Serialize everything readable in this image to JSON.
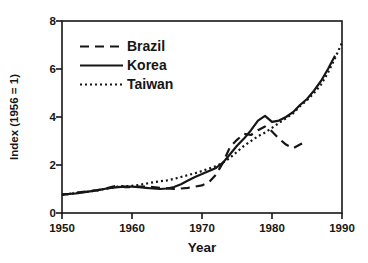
{
  "figure": {
    "background": "#ffffff",
    "ink_color": "#161616"
  },
  "chart_data": {
    "type": "line",
    "title": "",
    "xlabel": "Year",
    "ylabel": "Index (1956 = 1)",
    "xlim": [
      1950,
      1990
    ],
    "ylim": [
      0,
      8
    ],
    "x_ticks": [
      "1950",
      "1960",
      "1970",
      "1980",
      "1990"
    ],
    "y_ticks": [
      "0",
      "2",
      "4",
      "6",
      "8"
    ],
    "grid": false,
    "legend_position": "top-left",
    "series": [
      {
        "name": "Brazil",
        "line_style": "dashed",
        "points": [
          [
            1950,
            0.78
          ],
          [
            1951,
            0.8
          ],
          [
            1952,
            0.84
          ],
          [
            1953,
            0.88
          ],
          [
            1954,
            0.92
          ],
          [
            1955,
            0.95
          ],
          [
            1956,
            1.0
          ],
          [
            1957,
            1.08
          ],
          [
            1958,
            1.15
          ],
          [
            1959,
            1.08
          ],
          [
            1960,
            1.07
          ],
          [
            1961,
            1.1
          ],
          [
            1962,
            1.1
          ],
          [
            1963,
            1.08
          ],
          [
            1964,
            1.05
          ],
          [
            1965,
            1.03
          ],
          [
            1966,
            1.0
          ],
          [
            1967,
            1.02
          ],
          [
            1968,
            1.05
          ],
          [
            1969,
            1.1
          ],
          [
            1970,
            1.15
          ],
          [
            1971,
            1.28
          ],
          [
            1972,
            1.6
          ],
          [
            1973,
            2.1
          ],
          [
            1974,
            2.75
          ],
          [
            1975,
            3.05
          ],
          [
            1976,
            3.3
          ],
          [
            1977,
            3.25
          ],
          [
            1978,
            3.45
          ],
          [
            1979,
            3.6
          ],
          [
            1980,
            3.4
          ],
          [
            1981,
            3.1
          ],
          [
            1982,
            2.85
          ],
          [
            1983,
            2.7
          ],
          [
            1984,
            2.85
          ],
          [
            1985,
            3.0
          ]
        ]
      },
      {
        "name": "Korea",
        "line_style": "solid",
        "points": [
          [
            1950,
            0.75
          ],
          [
            1951,
            0.79
          ],
          [
            1952,
            0.82
          ],
          [
            1953,
            0.86
          ],
          [
            1954,
            0.9
          ],
          [
            1955,
            0.94
          ],
          [
            1956,
            1.0
          ],
          [
            1957,
            1.05
          ],
          [
            1958,
            1.08
          ],
          [
            1959,
            1.1
          ],
          [
            1960,
            1.1
          ],
          [
            1961,
            1.08
          ],
          [
            1962,
            1.05
          ],
          [
            1963,
            1.02
          ],
          [
            1964,
            1.0
          ],
          [
            1965,
            1.02
          ],
          [
            1966,
            1.08
          ],
          [
            1967,
            1.2
          ],
          [
            1968,
            1.35
          ],
          [
            1969,
            1.5
          ],
          [
            1970,
            1.62
          ],
          [
            1971,
            1.75
          ],
          [
            1972,
            1.88
          ],
          [
            1973,
            2.1
          ],
          [
            1974,
            2.45
          ],
          [
            1975,
            2.8
          ],
          [
            1976,
            3.1
          ],
          [
            1977,
            3.45
          ],
          [
            1978,
            3.85
          ],
          [
            1979,
            4.05
          ],
          [
            1980,
            3.8
          ],
          [
            1981,
            3.85
          ],
          [
            1982,
            4.0
          ],
          [
            1983,
            4.2
          ],
          [
            1984,
            4.5
          ],
          [
            1985,
            4.75
          ],
          [
            1986,
            5.1
          ],
          [
            1987,
            5.5
          ],
          [
            1988,
            6.0
          ],
          [
            1989,
            6.55
          ]
        ]
      },
      {
        "name": "Taiwan",
        "line_style": "dotted",
        "points": [
          [
            1950,
            0.75
          ],
          [
            1951,
            0.79
          ],
          [
            1952,
            0.83
          ],
          [
            1953,
            0.87
          ],
          [
            1954,
            0.9
          ],
          [
            1955,
            0.94
          ],
          [
            1956,
            1.0
          ],
          [
            1957,
            1.05
          ],
          [
            1958,
            1.1
          ],
          [
            1959,
            1.12
          ],
          [
            1960,
            1.13
          ],
          [
            1961,
            1.17
          ],
          [
            1962,
            1.22
          ],
          [
            1963,
            1.28
          ],
          [
            1964,
            1.32
          ],
          [
            1965,
            1.36
          ],
          [
            1966,
            1.42
          ],
          [
            1967,
            1.5
          ],
          [
            1968,
            1.58
          ],
          [
            1969,
            1.66
          ],
          [
            1970,
            1.75
          ],
          [
            1971,
            1.85
          ],
          [
            1972,
            1.95
          ],
          [
            1973,
            2.1
          ],
          [
            1974,
            2.3
          ],
          [
            1975,
            2.55
          ],
          [
            1976,
            2.8
          ],
          [
            1977,
            3.0
          ],
          [
            1978,
            3.2
          ],
          [
            1979,
            3.35
          ],
          [
            1980,
            3.55
          ],
          [
            1981,
            3.75
          ],
          [
            1982,
            3.95
          ],
          [
            1983,
            4.15
          ],
          [
            1984,
            4.45
          ],
          [
            1985,
            4.7
          ],
          [
            1986,
            5.0
          ],
          [
            1987,
            5.35
          ],
          [
            1988,
            5.85
          ],
          [
            1989,
            6.45
          ],
          [
            1990,
            7.1
          ]
        ]
      }
    ]
  }
}
